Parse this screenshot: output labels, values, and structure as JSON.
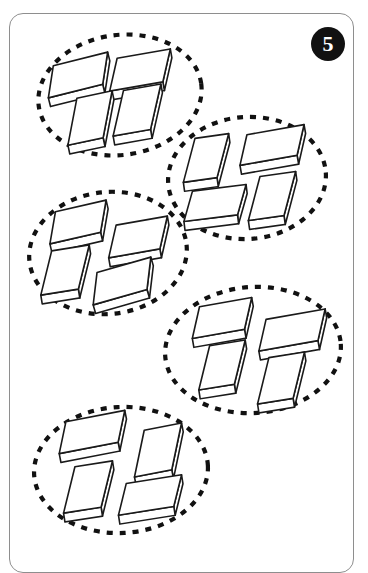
{
  "page": {
    "width": 368,
    "height": 548,
    "background": "#ffffff",
    "frame": {
      "name": "worksheet-card-frame",
      "border_color": "#8e8e8e",
      "corner_radius": 14
    }
  },
  "badge": {
    "label": "5",
    "shape": "filled-circle",
    "fill": "#111111",
    "text_color": "#ffffff",
    "cx": 328,
    "cy": 44,
    "r": 17
  },
  "style": {
    "outline_color": "#1a1a1a",
    "box_fill": "#ffffff",
    "dash_color": "#111111",
    "dash_length": 6,
    "dash_gap": 7,
    "dash_width": 4.2,
    "box_stroke_width": 1.6
  },
  "chart_data": {
    "type": "grouping-diagram",
    "group_count": 5,
    "items_per_group": 4,
    "total_items": 20,
    "item_name": "box",
    "group_marker": "dashed-ellipse",
    "groups": [
      {
        "id": "group-1",
        "label": "group-1-top-left",
        "count": 4,
        "ellipse": {
          "cx": 120,
          "cy": 95,
          "rx": 82,
          "ry": 60,
          "rot": -8
        },
        "boxes": [
          {
            "cx": 78,
            "cy": 75,
            "w": 56,
            "h": 30,
            "d": 9,
            "rot": -14
          },
          {
            "cx": 140,
            "cy": 70,
            "w": 54,
            "h": 31,
            "d": 9,
            "rot": -10
          },
          {
            "cx": 90,
            "cy": 118,
            "w": 36,
            "h": 44,
            "d": 9,
            "rot": -12
          },
          {
            "cx": 137,
            "cy": 110,
            "w": 38,
            "h": 43,
            "d": 9,
            "rot": -10
          }
        ]
      },
      {
        "id": "group-2",
        "label": "group-2-upper-right",
        "count": 4,
        "ellipse": {
          "cx": 247,
          "cy": 178,
          "rx": 79,
          "ry": 61,
          "rot": -4
        },
        "boxes": [
          {
            "cx": 206,
            "cy": 158,
            "w": 34,
            "h": 42,
            "d": 9,
            "rot": -8
          },
          {
            "cx": 272,
            "cy": 145,
            "w": 58,
            "h": 29,
            "d": 9,
            "rot": -10
          },
          {
            "cx": 215,
            "cy": 203,
            "w": 54,
            "h": 29,
            "d": 9,
            "rot": -7
          },
          {
            "cx": 272,
            "cy": 196,
            "w": 36,
            "h": 42,
            "d": 9,
            "rot": -8
          }
        ]
      },
      {
        "id": "group-3",
        "label": "group-3-middle-left",
        "count": 4,
        "ellipse": {
          "cx": 108,
          "cy": 253,
          "rx": 79,
          "ry": 61,
          "rot": -6
        },
        "boxes": [
          {
            "cx": 78,
            "cy": 222,
            "w": 52,
            "h": 30,
            "d": 9,
            "rot": -13
          },
          {
            "cx": 138,
            "cy": 237,
            "w": 52,
            "h": 31,
            "d": 9,
            "rot": -10
          },
          {
            "cx": 65,
            "cy": 270,
            "w": 38,
            "h": 42,
            "d": 9,
            "rot": -9
          },
          {
            "cx": 122,
            "cy": 281,
            "w": 56,
            "h": 30,
            "d": 9,
            "rot": -16
          }
        ]
      },
      {
        "id": "group-4",
        "label": "group-4-lower-right",
        "count": 4,
        "ellipse": {
          "cx": 253,
          "cy": 350,
          "rx": 88,
          "ry": 63,
          "rot": -4
        },
        "boxes": [
          {
            "cx": 222,
            "cy": 318,
            "w": 53,
            "h": 30,
            "d": 9,
            "rot": -10
          },
          {
            "cx": 292,
            "cy": 330,
            "w": 60,
            "h": 30,
            "d": 9,
            "rot": -10
          },
          {
            "cx": 222,
            "cy": 365,
            "w": 36,
            "h": 42,
            "d": 9,
            "rot": -9
          },
          {
            "cx": 281,
            "cy": 378,
            "w": 36,
            "h": 44,
            "d": 9,
            "rot": -9
          }
        ]
      },
      {
        "id": "group-5",
        "label": "group-5-bottom-left",
        "count": 4,
        "ellipse": {
          "cx": 121,
          "cy": 470,
          "rx": 87,
          "ry": 63,
          "rot": -3
        },
        "boxes": [
          {
            "cx": 92,
            "cy": 432,
            "w": 60,
            "h": 30,
            "d": 9,
            "rot": -11
          },
          {
            "cx": 158,
            "cy": 450,
            "w": 38,
            "h": 44,
            "d": 9,
            "rot": -11
          },
          {
            "cx": 88,
            "cy": 487,
            "w": 38,
            "h": 44,
            "d": 9,
            "rot": -9
          },
          {
            "cx": 150,
            "cy": 495,
            "w": 56,
            "h": 30,
            "d": 9,
            "rot": -9
          }
        ]
      }
    ]
  }
}
